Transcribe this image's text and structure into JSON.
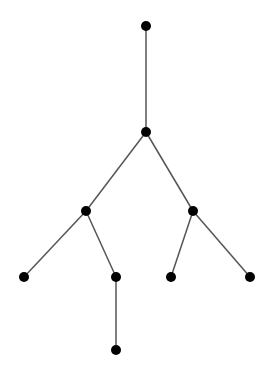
{
  "diagram": {
    "type": "tree",
    "node_color": "#000000",
    "edge_color": "#555555",
    "node_radius": 5,
    "nodes": [
      {
        "id": "n0",
        "x": 146,
        "y": 26
      },
      {
        "id": "n1",
        "x": 146,
        "y": 132
      },
      {
        "id": "n2",
        "x": 86,
        "y": 211
      },
      {
        "id": "n3",
        "x": 193,
        "y": 211
      },
      {
        "id": "n4",
        "x": 24,
        "y": 277
      },
      {
        "id": "n5",
        "x": 116,
        "y": 277
      },
      {
        "id": "n6",
        "x": 171,
        "y": 277
      },
      {
        "id": "n7",
        "x": 250,
        "y": 277
      },
      {
        "id": "n8",
        "x": 116,
        "y": 350
      }
    ],
    "edges": [
      [
        "n0",
        "n1"
      ],
      [
        "n1",
        "n2"
      ],
      [
        "n1",
        "n3"
      ],
      [
        "n2",
        "n4"
      ],
      [
        "n2",
        "n5"
      ],
      [
        "n3",
        "n6"
      ],
      [
        "n3",
        "n7"
      ],
      [
        "n5",
        "n8"
      ]
    ]
  }
}
